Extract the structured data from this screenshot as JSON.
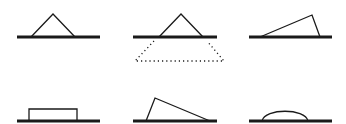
{
  "diagram": {
    "stroke_color": "#1a1a1a",
    "background_color": "#ffffff",
    "panels": [
      {
        "id": 1,
        "shape": "isosceles-triangle",
        "row": 1,
        "col": 1
      },
      {
        "id": 2,
        "shape": "isosceles-triangle-with-dotted-trapezoid-below",
        "row": 1,
        "col": 2
      },
      {
        "id": 3,
        "shape": "right-leaning-obtuse-triangle",
        "row": 1,
        "col": 3
      },
      {
        "id": 4,
        "shape": "flat-rectangle",
        "row": 2,
        "col": 1
      },
      {
        "id": 5,
        "shape": "left-leaning-obtuse-triangle",
        "row": 2,
        "col": 2
      },
      {
        "id": 6,
        "shape": "semi-elliptical-dome",
        "row": 2,
        "col": 3
      }
    ]
  }
}
